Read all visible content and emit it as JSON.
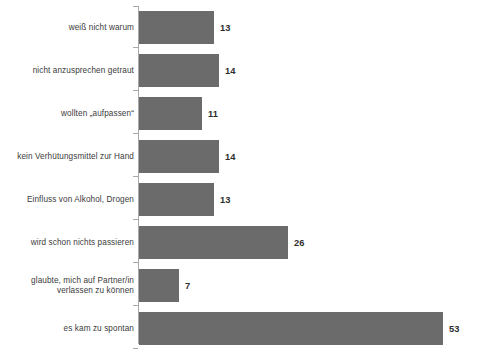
{
  "chart_data": {
    "type": "bar",
    "orientation": "horizontal",
    "title": "",
    "subtitle": "",
    "xlabel": "",
    "ylabel": "",
    "categories": [
      "weiß nicht warum",
      "nicht anzusprechen getraut",
      "wollten „aufpassen“",
      "kein Verhütungsmittel zur Hand",
      "Einfluss von Alkohol, Drogen",
      "wird schon nichts passieren",
      "glaubte, mich auf Partner/in verlassen zu können",
      "es kam zu spontan"
    ],
    "values": [
      13,
      14,
      11,
      14,
      13,
      26,
      7,
      53
    ],
    "value_labels": [
      "13",
      "14",
      "11",
      "14",
      "13",
      "26",
      "7",
      "53"
    ],
    "xlim": [
      0,
      58
    ],
    "grid": false,
    "legend": false,
    "bar_color": "#6b6b6b",
    "axis_color": "#a9a9a9",
    "label_color": "#3b3b3b",
    "value_color": "#2e2e2e"
  },
  "caption": {
    "text": "Quelle: ...",
    "visible": false
  }
}
